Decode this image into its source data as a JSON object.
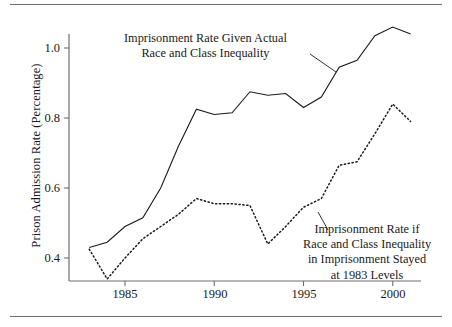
{
  "figure": {
    "name": "prison-admission-rate-line-chart",
    "top_rule": true,
    "bottom_rule": true
  },
  "axes": {
    "y_label": "Prison Admission Rate (Percentage)",
    "y_ticks": [
      "0.4",
      "0.6",
      "0.8",
      "1.0"
    ],
    "x_ticks": [
      "1985",
      "1990",
      "1995",
      "2000"
    ]
  },
  "annotations": {
    "actual": {
      "line1": "Imprisonment Rate Given Actual",
      "line2": "Race and Class Inequality"
    },
    "counterfactual": {
      "line1": "Imprisonment Rate if",
      "line2": "Race and Class Inequality",
      "line3": "in Imprisonment Stayed",
      "line4": "at 1983 Levels"
    }
  },
  "colors": {
    "ink": "#1a1a1a",
    "axis": "#6e6e6e",
    "rule": "#6e6e6e"
  },
  "chart_data": {
    "type": "line",
    "title": "",
    "xlabel": "",
    "ylabel": "Prison Admission Rate (Percentage)",
    "xlim": [
      1983,
      2001
    ],
    "ylim": [
      0.32,
      1.08
    ],
    "xticks": [
      1985,
      1990,
      1995,
      2000
    ],
    "yticks": [
      0.4,
      0.6,
      0.8,
      1.0
    ],
    "grid": false,
    "legend": "annotations-inline",
    "x": [
      1983,
      1984,
      1985,
      1986,
      1987,
      1988,
      1989,
      1990,
      1991,
      1992,
      1993,
      1994,
      1995,
      1996,
      1997,
      1998,
      1999,
      2000,
      2001
    ],
    "series": [
      {
        "name": "Imprisonment Rate Given Actual Race and Class Inequality",
        "style": "solid",
        "values": [
          0.43,
          0.445,
          0.49,
          0.515,
          0.6,
          0.72,
          0.825,
          0.81,
          0.815,
          0.875,
          0.865,
          0.87,
          0.83,
          0.86,
          0.945,
          0.965,
          1.035,
          1.06,
          1.04
        ]
      },
      {
        "name": "Imprisonment Rate if Race and Class Inequality in Imprisonment Stayed at 1983 Levels",
        "style": "dotted",
        "values": [
          0.425,
          0.34,
          0.4,
          0.455,
          0.49,
          0.525,
          0.57,
          0.555,
          0.555,
          0.55,
          0.44,
          0.49,
          0.545,
          0.57,
          0.665,
          0.675,
          0.755,
          0.84,
          0.79
        ]
      }
    ]
  }
}
